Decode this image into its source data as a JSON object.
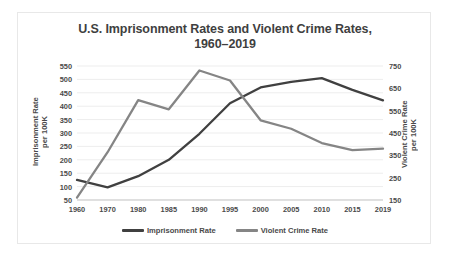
{
  "chart_data": {
    "type": "line",
    "title": "U.S. Imprisonment Rates and Violent Crime Rates, 1960–2019",
    "title_line1": "U.S. Imprisonment Rates and Violent Crime Rates,",
    "title_line2": "1960–2019",
    "xlabel": "",
    "categories": [
      "1960",
      "1970",
      "1980",
      "1985",
      "1990",
      "1995",
      "2000",
      "2005",
      "2010",
      "2015",
      "2019"
    ],
    "grid": true,
    "legend_position": "bottom",
    "series": [
      {
        "name": "Imprisonment Rate",
        "axis": "left",
        "color": "#404040",
        "values": [
          125,
          97,
          139,
          200,
          297,
          411,
          470,
          491,
          505,
          461,
          422
        ]
      },
      {
        "name": "Violent Crime Rate",
        "axis": "right",
        "color": "#858585",
        "values": [
          161,
          364,
          597,
          556,
          730,
          685,
          507,
          469,
          405,
          373,
          380
        ]
      }
    ],
    "left_axis": {
      "label_line1": "Imprisonment Rate",
      "label_line2": "per 100K",
      "ticks": [
        50,
        100,
        150,
        200,
        250,
        300,
        350,
        400,
        450,
        500,
        550
      ],
      "min": 50,
      "max": 550,
      "step": 50
    },
    "right_axis": {
      "label_line1": "Violent Crime Rate",
      "label_line2": "per 100K",
      "ticks": [
        150,
        250,
        350,
        450,
        550,
        650,
        750
      ],
      "min": 150,
      "max": 750,
      "step": 100
    },
    "colors": {
      "imprisonment": "#404040",
      "violent_crime": "#858585",
      "grid": "#ededed",
      "axis": "#c9c9c9",
      "text": "#4a4a4a",
      "frame": "#e8e8e8",
      "background": "#ffffff"
    }
  }
}
